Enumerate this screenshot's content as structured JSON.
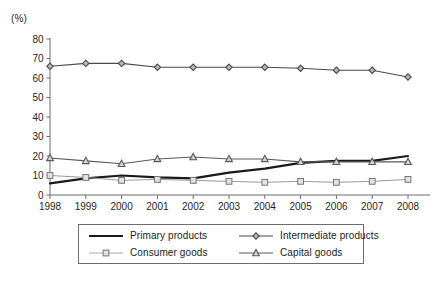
{
  "chart_data": {
    "type": "line",
    "title": "",
    "xlabel": "",
    "ylabel": "(%)",
    "unit_label": "(%)",
    "x": [
      1998,
      1999,
      2000,
      2001,
      2002,
      2003,
      2004,
      2005,
      2006,
      2007,
      2008
    ],
    "categories": [
      "1998",
      "1999",
      "2000",
      "2001",
      "2002",
      "2003",
      "2004",
      "2005",
      "2006",
      "2007",
      "2008"
    ],
    "xtick_labels": [
      "1998",
      "1999",
      "2000",
      "2001",
      "2002",
      "2003",
      "2004",
      "2005",
      "2006",
      "2007",
      "2008"
    ],
    "ytick_labels": [
      "0",
      "10",
      "20",
      "30",
      "40",
      "50",
      "60",
      "70",
      "80"
    ],
    "yticks": [
      0,
      10,
      20,
      30,
      40,
      50,
      60,
      70,
      80
    ],
    "ylim": [
      0,
      80
    ],
    "xlim": [
      1998,
      2008
    ],
    "grid": false,
    "legend_position": "bottom",
    "series": [
      {
        "name": "Primary products",
        "marker": "none",
        "color": "#1a1a1a",
        "line_width": 2.2,
        "values": [
          6.0,
          8.5,
          10.0,
          9.0,
          8.5,
          11.5,
          13.5,
          16.5,
          17.5,
          17.5,
          20.0
        ]
      },
      {
        "name": "Intermediate products",
        "marker": "diamond",
        "color": "#4a4a4a",
        "line_width": 1.1,
        "values": [
          66.0,
          67.5,
          67.5,
          65.5,
          65.5,
          65.5,
          65.5,
          65.0,
          64.0,
          64.0,
          60.5
        ]
      },
      {
        "name": "Consumer goods",
        "marker": "square",
        "color": "#9a9a9a",
        "line_width": 1.0,
        "values": [
          10.0,
          9.0,
          7.5,
          8.0,
          7.5,
          7.0,
          6.5,
          7.0,
          6.5,
          7.0,
          8.0
        ]
      },
      {
        "name": "Capital goods",
        "marker": "triangle",
        "color": "#5a5a5a",
        "line_width": 1.1,
        "values": [
          19.0,
          17.5,
          16.0,
          18.5,
          19.5,
          18.5,
          18.5,
          17.0,
          17.0,
          17.0,
          17.0
        ]
      }
    ]
  },
  "legend": {
    "entries": [
      {
        "label": "Primary products",
        "marker": "none",
        "color": "#1a1a1a"
      },
      {
        "label": "Intermediate products",
        "marker": "diamond",
        "color": "#4a4a4a"
      },
      {
        "label": "Consumer goods",
        "marker": "square",
        "color": "#9a9a9a"
      },
      {
        "label": "Capital goods",
        "marker": "triangle",
        "color": "#5a5a5a"
      }
    ]
  },
  "axis": {
    "unit": "(%)",
    "axis_color": "#6d6d6d"
  }
}
